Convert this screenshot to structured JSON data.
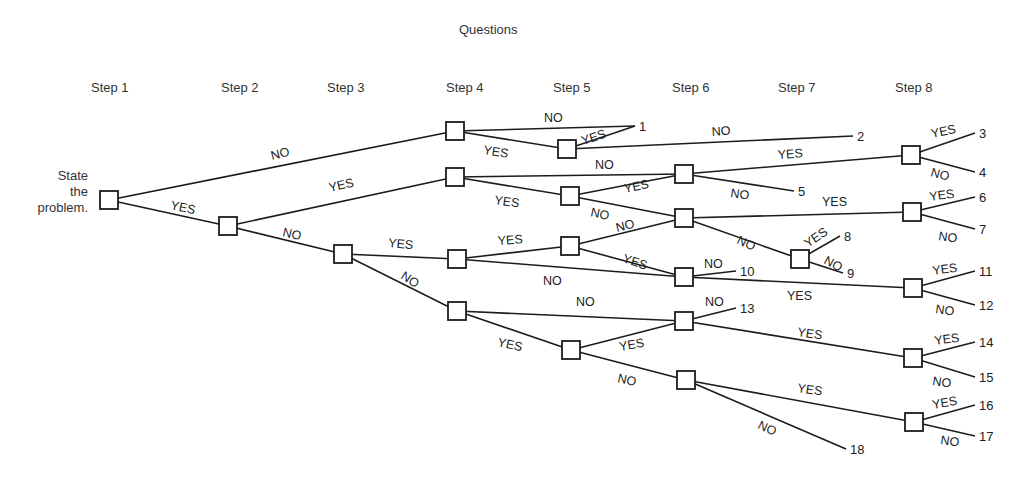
{
  "title": "Questions",
  "steps": [
    {
      "label": "Step 1",
      "x": 91
    },
    {
      "label": "Step 2",
      "x": 221
    },
    {
      "label": "Step 3",
      "x": 327
    },
    {
      "label": "Step 4",
      "x": 446
    },
    {
      "label": "Step 5",
      "x": 553
    },
    {
      "label": "Step 6",
      "x": 672
    },
    {
      "label": "Step 7",
      "x": 778
    },
    {
      "label": "Step 8",
      "x": 895
    }
  ],
  "start_label": [
    "State",
    "the",
    "problem."
  ],
  "colors": {
    "line": "#1c1c1c",
    "text": "#2a2a2a",
    "background": "#ffffff"
  },
  "nodes": [
    {
      "id": "s1",
      "step": 1,
      "x": 109,
      "y": 200
    },
    {
      "id": "s2",
      "step": 2,
      "x": 228,
      "y": 226
    },
    {
      "id": "s3",
      "step": 3,
      "x": 343,
      "y": 254
    },
    {
      "id": "s4a",
      "step": 4,
      "x": 455,
      "y": 131
    },
    {
      "id": "s4b",
      "step": 4,
      "x": 455,
      "y": 177
    },
    {
      "id": "s4c",
      "step": 4,
      "x": 457,
      "y": 259
    },
    {
      "id": "s4d",
      "step": 4,
      "x": 457,
      "y": 311
    },
    {
      "id": "s5a",
      "step": 5,
      "x": 567,
      "y": 149
    },
    {
      "id": "s5b",
      "step": 5,
      "x": 570,
      "y": 196
    },
    {
      "id": "s5c",
      "step": 5,
      "x": 570,
      "y": 246
    },
    {
      "id": "s5d",
      "step": 5,
      "x": 571,
      "y": 350
    },
    {
      "id": "s6a",
      "step": 6,
      "x": 684,
      "y": 174
    },
    {
      "id": "s6b",
      "step": 6,
      "x": 684,
      "y": 218
    },
    {
      "id": "s6c",
      "step": 6,
      "x": 684,
      "y": 277
    },
    {
      "id": "s6d",
      "step": 6,
      "x": 684,
      "y": 321
    },
    {
      "id": "s6e",
      "step": 6,
      "x": 686,
      "y": 380
    },
    {
      "id": "s7a",
      "step": 7,
      "x": 800,
      "y": 259
    },
    {
      "id": "s8a",
      "step": 8,
      "x": 911,
      "y": 155
    },
    {
      "id": "s8b",
      "step": 8,
      "x": 912,
      "y": 212
    },
    {
      "id": "s8c",
      "step": 8,
      "x": 913,
      "y": 288
    },
    {
      "id": "s8d",
      "step": 8,
      "x": 913,
      "y": 358
    },
    {
      "id": "s8e",
      "step": 8,
      "x": 914,
      "y": 422
    }
  ],
  "endpoints": [
    {
      "label": "1",
      "x": 635,
      "y": 126
    },
    {
      "label": "2",
      "x": 853,
      "y": 136
    },
    {
      "label": "3",
      "x": 975,
      "y": 133
    },
    {
      "label": "4",
      "x": 975,
      "y": 172
    },
    {
      "label": "5",
      "x": 794,
      "y": 191
    },
    {
      "label": "6",
      "x": 975,
      "y": 197
    },
    {
      "label": "7",
      "x": 975,
      "y": 229
    },
    {
      "label": "8",
      "x": 840,
      "y": 236
    },
    {
      "label": "9",
      "x": 843,
      "y": 273
    },
    {
      "label": "10",
      "x": 736,
      "y": 271
    },
    {
      "label": "11",
      "x": 975,
      "y": 271
    },
    {
      "label": "12",
      "x": 975,
      "y": 305
    },
    {
      "label": "13",
      "x": 736,
      "y": 308
    },
    {
      "label": "14",
      "x": 975,
      "y": 342
    },
    {
      "label": "15",
      "x": 975,
      "y": 377
    },
    {
      "label": "16",
      "x": 975,
      "y": 405
    },
    {
      "label": "17",
      "x": 975,
      "y": 436
    },
    {
      "label": "18",
      "x": 846,
      "y": 449
    }
  ],
  "edges": [
    {
      "from": "s1",
      "to": "s4a",
      "label": "NO",
      "lx": 272,
      "ly": 160,
      "rot": -14
    },
    {
      "from": "s1",
      "to": "s2",
      "label": "YES",
      "lx": 170,
      "ly": 209,
      "rot": 12
    },
    {
      "from": "s2",
      "to": "s4b",
      "label": "YES",
      "lx": 330,
      "ly": 192,
      "rot": -13
    },
    {
      "from": "s2",
      "to": "s3",
      "label": "NO",
      "lx": 282,
      "ly": 236,
      "rot": 13
    },
    {
      "from": "s4a",
      "to": "e1",
      "label": "NO",
      "lx": 544,
      "ly": 122,
      "rot": 0
    },
    {
      "from": "s4a",
      "to": "s5a",
      "label": "YES",
      "lx": 483,
      "ly": 154,
      "rot": 9
    },
    {
      "from": "s5a",
      "to": "e1",
      "label": "YES",
      "lx": 583,
      "ly": 145,
      "rot": -18
    },
    {
      "from": "s5a",
      "to": "e2",
      "label": "NO",
      "lx": 712,
      "ly": 136,
      "rot": -4
    },
    {
      "from": "s4b",
      "to": "s6a",
      "label": "NO",
      "lx": 595,
      "ly": 169,
      "rot": 0
    },
    {
      "from": "s4b",
      "to": "s5b",
      "label": "YES",
      "lx": 494,
      "ly": 204,
      "rot": 8
    },
    {
      "from": "s5b",
      "to": "s6a",
      "label": "YES",
      "lx": 625,
      "ly": 193,
      "rot": -12
    },
    {
      "from": "s5b",
      "to": "s6b",
      "label": "NO",
      "lx": 590,
      "ly": 216,
      "rot": 12
    },
    {
      "from": "s3",
      "to": "s4c",
      "label": "YES",
      "lx": 388,
      "ly": 247,
      "rot": 5
    },
    {
      "from": "s3",
      "to": "s4d",
      "label": "NO",
      "lx": 400,
      "ly": 278,
      "rot": 33
    },
    {
      "from": "s4c",
      "to": "s5c",
      "label": "YES",
      "lx": 498,
      "ly": 245,
      "rot": -4
    },
    {
      "from": "s4c",
      "to": "s6c",
      "label": "NO",
      "lx": 543,
      "ly": 285,
      "rot": 0
    },
    {
      "from": "s5c",
      "to": "s6b",
      "label": "NO",
      "lx": 617,
      "ly": 232,
      "rot": -14
    },
    {
      "from": "s5c",
      "to": "s6c",
      "label": "YES",
      "lx": 622,
      "ly": 262,
      "rot": 18
    },
    {
      "from": "s6a",
      "to": "s8a",
      "label": "YES",
      "lx": 778,
      "ly": 159,
      "rot": -4
    },
    {
      "from": "s6a",
      "to": "e5",
      "label": "NO",
      "lx": 730,
      "ly": 197,
      "rot": 8
    },
    {
      "from": "s6b",
      "to": "s8b",
      "label": "YES",
      "lx": 822,
      "ly": 206,
      "rot": 0
    },
    {
      "from": "s6b",
      "to": "s7a",
      "label": "NO",
      "lx": 736,
      "ly": 243,
      "rot": 25
    },
    {
      "from": "s7a",
      "to": "e8",
      "label": "YES",
      "lx": 808,
      "ly": 248,
      "rot": -35
    },
    {
      "from": "s7a",
      "to": "e9",
      "label": "NO",
      "lx": 823,
      "ly": 263,
      "rot": 28
    },
    {
      "from": "s6c",
      "to": "e10",
      "label": "NO",
      "lx": 704,
      "ly": 268,
      "rot": 0
    },
    {
      "from": "s6c",
      "to": "s8c",
      "label": "YES",
      "lx": 787,
      "ly": 300,
      "rot": 0
    },
    {
      "from": "s4d",
      "to": "s6d",
      "label": "NO",
      "lx": 576,
      "ly": 306,
      "rot": 0
    },
    {
      "from": "s4d",
      "to": "s5d",
      "label": "YES",
      "lx": 497,
      "ly": 346,
      "rot": 12
    },
    {
      "from": "s5d",
      "to": "s6d",
      "label": "YES",
      "lx": 620,
      "ly": 351,
      "rot": -10
    },
    {
      "from": "s5d",
      "to": "s6e",
      "label": "NO",
      "lx": 617,
      "ly": 382,
      "rot": 12
    },
    {
      "from": "s6d",
      "to": "e13",
      "label": "NO",
      "lx": 705,
      "ly": 306,
      "rot": 0
    },
    {
      "from": "s6d",
      "to": "s8d",
      "label": "YES",
      "lx": 797,
      "ly": 336,
      "rot": 8
    },
    {
      "from": "s6e",
      "to": "s8e",
      "label": "YES",
      "lx": 797,
      "ly": 392,
      "rot": 8
    },
    {
      "from": "s6e",
      "to": "e18",
      "label": "NO",
      "lx": 757,
      "ly": 428,
      "rot": 25
    },
    {
      "from": "s8a",
      "to": "e3",
      "label": "YES",
      "lx": 932,
      "ly": 138,
      "rot": -12
    },
    {
      "from": "s8a",
      "to": "e4",
      "label": "NO",
      "lx": 930,
      "ly": 176,
      "rot": 15
    },
    {
      "from": "s8b",
      "to": "e6",
      "label": "YES",
      "lx": 930,
      "ly": 201,
      "rot": -8
    },
    {
      "from": "s8b",
      "to": "e7",
      "label": "NO",
      "lx": 938,
      "ly": 240,
      "rot": 8
    },
    {
      "from": "s8c",
      "to": "e11",
      "label": "YES",
      "lx": 933,
      "ly": 275,
      "rot": -8
    },
    {
      "from": "s8c",
      "to": "e12",
      "label": "NO",
      "lx": 935,
      "ly": 313,
      "rot": 8
    },
    {
      "from": "s8d",
      "to": "e14",
      "label": "YES",
      "lx": 935,
      "ly": 345,
      "rot": -8
    },
    {
      "from": "s8d",
      "to": "e15",
      "label": "NO",
      "lx": 932,
      "ly": 385,
      "rot": 8
    },
    {
      "from": "s8e",
      "to": "e16",
      "label": "YES",
      "lx": 933,
      "ly": 409,
      "rot": -10
    },
    {
      "from": "s8e",
      "to": "e17",
      "label": "NO",
      "lx": 940,
      "ly": 444,
      "rot": 8
    }
  ]
}
